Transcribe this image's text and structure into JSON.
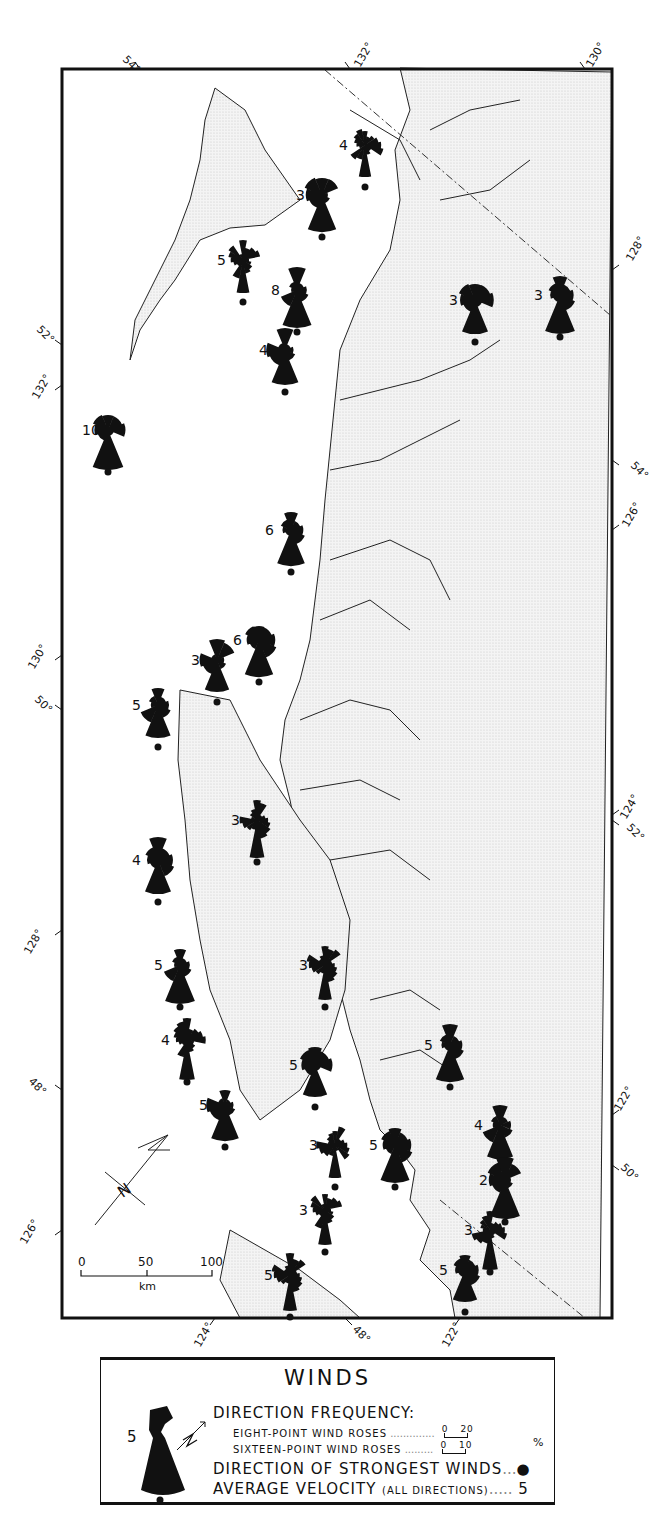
{
  "map": {
    "title": "Winds",
    "frame_color": "#111111",
    "land_color": "#ececec",
    "water_color": "#ffffff",
    "rose_color": "#111111",
    "graticule_labels": {
      "top": [
        "54°",
        "132°",
        "130°"
      ],
      "left": [
        "52°",
        "132°",
        "130°",
        "50°",
        "128°",
        "48°",
        "126°"
      ],
      "right": [
        "128°",
        "54°",
        "126°",
        "124°",
        "52°",
        "122°",
        "50°"
      ],
      "bottom": [
        "124°",
        "48°",
        "122°"
      ]
    },
    "scale_bar": {
      "ticks": [
        "0",
        "50",
        "100"
      ],
      "unit": "km"
    },
    "north_arrow": {
      "label": "N"
    },
    "stations": [
      {
        "id": 1,
        "velocity": "4",
        "x": 365,
        "y": 145,
        "type": "sixteen-point"
      },
      {
        "id": 2,
        "velocity": "3",
        "x": 322,
        "y": 195,
        "type": "eight-point"
      },
      {
        "id": 3,
        "velocity": "5",
        "x": 243,
        "y": 260,
        "type": "sixteen-point"
      },
      {
        "id": 4,
        "velocity": "8",
        "x": 297,
        "y": 290,
        "type": "eight-point"
      },
      {
        "id": 5,
        "velocity": "3",
        "x": 475,
        "y": 300,
        "type": "eight-point"
      },
      {
        "id": 6,
        "velocity": "3",
        "x": 560,
        "y": 295,
        "type": "eight-point"
      },
      {
        "id": 7,
        "velocity": "4",
        "x": 285,
        "y": 350,
        "type": "eight-point"
      },
      {
        "id": 8,
        "velocity": "10",
        "x": 108,
        "y": 430,
        "type": "eight-point"
      },
      {
        "id": 9,
        "velocity": "6",
        "x": 291,
        "y": 530,
        "type": "eight-point"
      },
      {
        "id": 10,
        "velocity": "3",
        "x": 217,
        "y": 660,
        "type": "eight-point"
      },
      {
        "id": 11,
        "velocity": "6",
        "x": 259,
        "y": 640,
        "type": "eight-point"
      },
      {
        "id": 12,
        "velocity": "5",
        "x": 158,
        "y": 705,
        "type": "eight-point"
      },
      {
        "id": 13,
        "velocity": "3",
        "x": 257,
        "y": 820,
        "type": "sixteen-point"
      },
      {
        "id": 14,
        "velocity": "4",
        "x": 158,
        "y": 860,
        "type": "eight-point"
      },
      {
        "id": 15,
        "velocity": "5",
        "x": 180,
        "y": 965,
        "type": "eight-point"
      },
      {
        "id": 16,
        "velocity": "3",
        "x": 325,
        "y": 965,
        "type": "sixteen-point"
      },
      {
        "id": 17,
        "velocity": "4",
        "x": 187,
        "y": 1040,
        "type": "sixteen-point"
      },
      {
        "id": 18,
        "velocity": "5",
        "x": 225,
        "y": 1105,
        "type": "eight-point"
      },
      {
        "id": 19,
        "velocity": "5",
        "x": 315,
        "y": 1065,
        "type": "eight-point"
      },
      {
        "id": 20,
        "velocity": "5",
        "x": 450,
        "y": 1045,
        "type": "eight-point"
      },
      {
        "id": 21,
        "velocity": "3",
        "x": 335,
        "y": 1145,
        "type": "sixteen-point"
      },
      {
        "id": 22,
        "velocity": "5",
        "x": 395,
        "y": 1145,
        "type": "eight-point"
      },
      {
        "id": 23,
        "velocity": "4",
        "x": 500,
        "y": 1125,
        "type": "eight-point"
      },
      {
        "id": 24,
        "velocity": "2",
        "x": 505,
        "y": 1180,
        "type": "eight-point"
      },
      {
        "id": 25,
        "velocity": "3",
        "x": 325,
        "y": 1210,
        "type": "sixteen-point"
      },
      {
        "id": 26,
        "velocity": "3",
        "x": 490,
        "y": 1230,
        "type": "sixteen-point"
      },
      {
        "id": 27,
        "velocity": "5",
        "x": 290,
        "y": 1275,
        "type": "sixteen-point"
      },
      {
        "id": 28,
        "velocity": "5",
        "x": 465,
        "y": 1270,
        "type": "eight-point"
      }
    ]
  },
  "legend": {
    "title": "WINDS",
    "example_velocity": "5",
    "direction_frequency_label": "DIRECTION FREQUENCY:",
    "eight_point_label": "EIGHT-POINT WIND ROSES",
    "eight_point_scale": {
      "min": "0",
      "max": "20"
    },
    "sixteen_point_label": "SIXTEEN-POINT WIND ROSES",
    "sixteen_point_scale": {
      "min": "0",
      "max": "10"
    },
    "percent_unit": "%",
    "strongest_label": "DIRECTION OF STRONGEST WINDS",
    "strongest_symbol": "●",
    "velocity_label": "AVERAGE VELOCITY",
    "velocity_qualifier": "(ALL DIRECTIONS)",
    "velocity_symbol": "5"
  }
}
